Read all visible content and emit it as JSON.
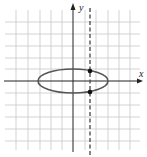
{
  "figure": {
    "axes": {
      "x_label": "x",
      "y_label": "y"
    },
    "grid": {
      "unit_px": 11.5,
      "x_range": [
        -5,
        5
      ],
      "y_range": [
        -5,
        5
      ]
    },
    "ellipse": {
      "center": [
        0,
        0
      ],
      "semi_major_x": 3,
      "semi_minor_y": 1,
      "color": "#555555"
    },
    "dashed_line": {
      "equation": "x = 1.5",
      "x": 1.5,
      "color": "#444444"
    },
    "intersection_points": [
      {
        "x": 1.5,
        "y": 1
      },
      {
        "x": 1.5,
        "y": -1
      }
    ],
    "colors": {
      "grid": "#c8c8c8",
      "axis": "#222222",
      "point": "#111111"
    }
  }
}
